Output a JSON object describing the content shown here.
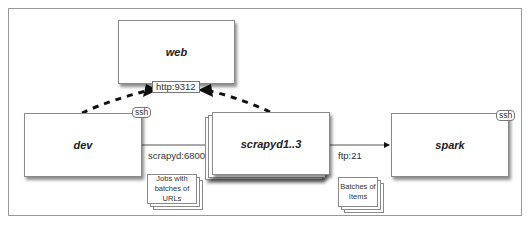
{
  "diagram": {
    "nodes": {
      "web": "web",
      "dev": "dev",
      "scrapyd": "scrapyd1..3",
      "spark": "spark"
    },
    "tags": {
      "dev_ssh": "ssh",
      "spark_ssh": "ssh"
    },
    "ports": {
      "web_http": "http:9312"
    },
    "edges": {
      "dev_to_scrapyd": "scrapyd:6800",
      "scrapyd_to_spark": "ftp:21"
    },
    "notes": {
      "jobs": "Jobs with batches of URLs",
      "batches": "Batches of Items"
    },
    "colors": {
      "border": "#8a8a8a",
      "arrow": "#111111",
      "frame": "#9a9a9a"
    }
  }
}
